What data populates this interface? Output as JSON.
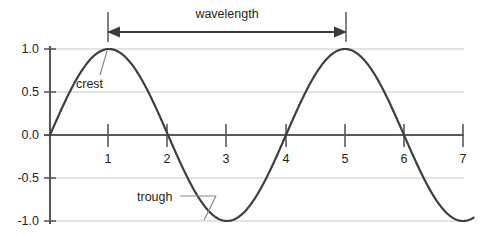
{
  "chart_data": {
    "type": "line",
    "title": "",
    "subtitle": "",
    "xlabel": "",
    "ylabel": "",
    "xlim": [
      0,
      7
    ],
    "ylim": [
      -1.0,
      1.0
    ],
    "grid": true,
    "legend_position": "none",
    "x_ticks": [
      "1",
      "2",
      "3",
      "4",
      "5",
      "6",
      "7"
    ],
    "x_tick_values": [
      1,
      2,
      3,
      4,
      5,
      6,
      7
    ],
    "y_ticks": [
      "1.0",
      "0.5",
      "0.0",
      "-0.5",
      "-1.0"
    ],
    "y_tick_values": [
      1.0,
      0.5,
      0.0,
      -0.5,
      -1.0
    ],
    "series": [
      {
        "name": "wave",
        "color": "#3f3f3f",
        "function": "sin(2*pi*x/4)",
        "period": 4,
        "amplitude": 1.0,
        "x": [
          0,
          0.25,
          0.5,
          0.75,
          1,
          1.25,
          1.5,
          1.75,
          2,
          2.25,
          2.5,
          2.75,
          3,
          3.25,
          3.5,
          3.75,
          4,
          4.25,
          4.5,
          4.75,
          5,
          5.25,
          5.5,
          5.75,
          6,
          6.25,
          6.5,
          6.75,
          7
        ],
        "values": [
          0.0,
          0.38,
          0.71,
          0.92,
          1.0,
          0.92,
          0.71,
          0.38,
          0.0,
          -0.38,
          -0.71,
          -0.92,
          -1.0,
          -0.92,
          -0.71,
          -0.38,
          0.0,
          0.38,
          0.71,
          0.92,
          1.0,
          0.92,
          0.71,
          0.38,
          0.0,
          -0.38,
          -0.71,
          -0.92,
          -1.0
        ]
      }
    ],
    "annotations": [
      {
        "id": "wavelength",
        "label": "wavelength",
        "type": "double-arrow",
        "from_x": 1,
        "to_x": 5,
        "value": 4
      },
      {
        "id": "crest",
        "label": "crest",
        "type": "leader",
        "point_x": 1,
        "point_y": 1.0
      },
      {
        "id": "trough",
        "label": "trough",
        "type": "leader",
        "point_x": 3,
        "point_y": -1.0
      }
    ]
  },
  "colors": {
    "curve": "#3f3f3f",
    "axis": "#58595b",
    "grid": "#d9d9d9",
    "text": "#231f20",
    "arrow": "#3a3a3a",
    "leader": "#8a8a8a"
  }
}
